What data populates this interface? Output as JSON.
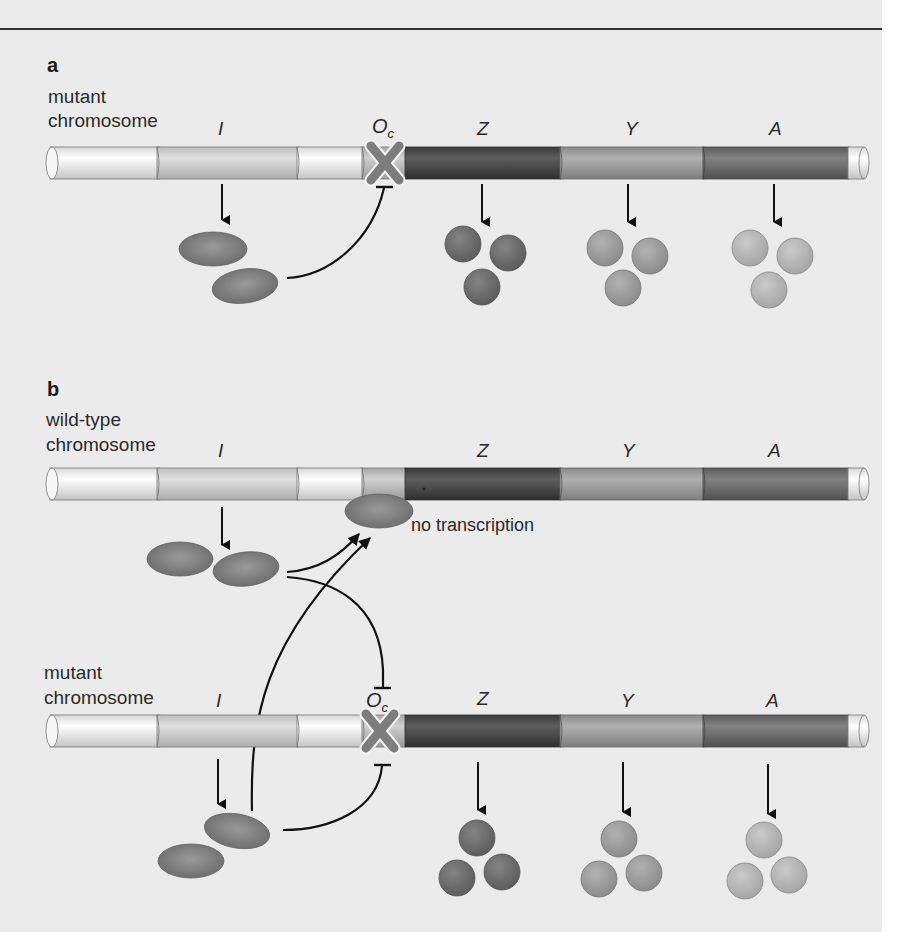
{
  "figure": {
    "panel_a": {
      "letter": "a",
      "chromosome_label_line1": "mutant",
      "chromosome_label_line2": "chromosome",
      "genes": {
        "I": "I",
        "O": "O",
        "O_sub": "c",
        "Z": "Z",
        "Y": "Y",
        "A": "A"
      }
    },
    "panel_b": {
      "letter": "b",
      "wildtype": {
        "chromosome_label_line1": "wild-type",
        "chromosome_label_line2": "chromosome",
        "genes": {
          "I": "I",
          "Z": "Z",
          "Y": "Y",
          "A": "A"
        },
        "annotation": "no transcription"
      },
      "mutant": {
        "chromosome_label_line1": "mutant",
        "chromosome_label_line2": "chromosome",
        "genes": {
          "I": "I",
          "O": "O",
          "O_sub": "c",
          "Z": "Z",
          "Y": "Y",
          "A": "A"
        }
      }
    },
    "colors": {
      "background": "#ebebeb",
      "lacI_segment": "#d6d6d6",
      "operator_segment": "#c2c2c2",
      "z_segment": "#4a4a4a",
      "y_segment": "#9a9a9a",
      "a_segment": "#6e6e6e",
      "repressor": "#7a7a7a",
      "mutation_cross": "#7d7d7d",
      "z_protein": "#6c6c6c",
      "y_protein": "#9c9c9c",
      "a_protein": "#b4b4b4"
    }
  }
}
